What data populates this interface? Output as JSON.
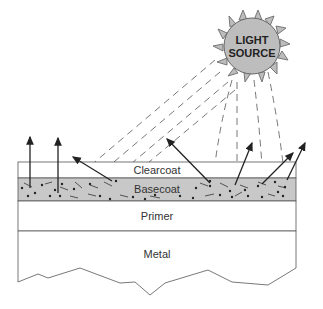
{
  "diagram": {
    "light_source": {
      "line1": "LIGHT",
      "line2": "SOURCE",
      "fill": "#bdbdbd"
    },
    "layers": [
      {
        "name": "Clearcoat",
        "fill": "#ffffff"
      },
      {
        "name": "Basecoat",
        "fill": "#c8c8c8"
      },
      {
        "name": "Primer",
        "fill": "#ffffff"
      },
      {
        "name": "Metal",
        "fill": "#ffffff"
      }
    ]
  }
}
